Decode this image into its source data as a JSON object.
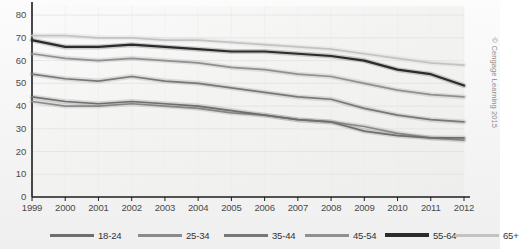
{
  "credit": "© Cengage Learning 2015",
  "chart_data": {
    "type": "line",
    "title": "",
    "subtitle": "",
    "xlabel": "",
    "ylabel": "",
    "x": [
      1999,
      2000,
      2001,
      2002,
      2003,
      2004,
      2005,
      2006,
      2007,
      2008,
      2009,
      2010,
      2011,
      2012
    ],
    "xtick_labels": [
      "1999",
      "2000",
      "2001",
      "2002",
      "2003",
      "2004",
      "2005",
      "2006",
      "2007",
      "2008",
      "2009",
      "2010",
      "2011",
      "2012"
    ],
    "ytick_labels": [
      "0",
      "10",
      "20",
      "30",
      "40",
      "50",
      "60",
      "70",
      "80"
    ],
    "ytick_values": [
      0,
      10,
      20,
      30,
      40,
      50,
      60,
      70,
      80
    ],
    "ylim": [
      0,
      84
    ],
    "xlim": [
      1999,
      2012
    ],
    "grid": true,
    "legend_position": "bottom",
    "series": [
      {
        "name": "18-24",
        "color": "#6e6e6e",
        "values": [
          44,
          42,
          41,
          42,
          41,
          40,
          38,
          36,
          34,
          33,
          29,
          27,
          26,
          26
        ]
      },
      {
        "name": "25-34",
        "color": "#8a8a8a",
        "values": [
          42,
          40,
          40,
          41,
          40,
          39,
          37,
          36,
          34,
          33,
          31,
          28,
          26,
          25
        ]
      },
      {
        "name": "35-44",
        "color": "#787878",
        "values": [
          54,
          52,
          51,
          53,
          51,
          50,
          48,
          46,
          44,
          43,
          39,
          36,
          34,
          33
        ]
      },
      {
        "name": "45-54",
        "color": "#909090",
        "values": [
          63,
          61,
          60,
          61,
          60,
          59,
          57,
          56,
          54,
          53,
          50,
          47,
          45,
          44
        ]
      },
      {
        "name": "55-64",
        "color": "#2b2b2b",
        "values": [
          69,
          66,
          66,
          67,
          66,
          65,
          64,
          64,
          63,
          62,
          60,
          56,
          54,
          49
        ]
      },
      {
        "name": "65+",
        "color": "#c3c3c3",
        "values": [
          71,
          71,
          70,
          70,
          69,
          69,
          68,
          67,
          66,
          65,
          63,
          61,
          59,
          58
        ]
      }
    ]
  },
  "legend": {
    "items": [
      {
        "label": "18-24",
        "color": "#6e6e6e"
      },
      {
        "label": "25-34",
        "color": "#8a8a8a"
      },
      {
        "label": "35-44",
        "color": "#787878"
      },
      {
        "label": "45-54",
        "color": "#909090"
      },
      {
        "label": "55-64",
        "color": "#2b2b2b"
      },
      {
        "label": "65+",
        "color": "#c3c3c3"
      }
    ]
  }
}
